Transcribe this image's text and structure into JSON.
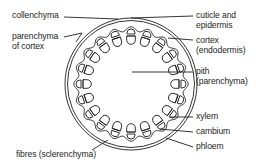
{
  "diagram": {
    "colors": {
      "ink": "#1e1e1e",
      "background": "#ffffff"
    },
    "labels_left": [
      {
        "id": "collenchyma",
        "lines": [
          "collenchyma"
        ]
      },
      {
        "id": "parenchyma-of-cortex",
        "lines": [
          "parenchyma",
          "of cortex"
        ]
      },
      {
        "id": "fibres",
        "lines": [
          "fibres (sclerenchyma)"
        ]
      }
    ],
    "labels_right": [
      {
        "id": "cuticle-and-epidermis",
        "lines": [
          "cuticle and",
          "epidermis"
        ]
      },
      {
        "id": "cortex-endodermis",
        "lines": [
          "cortex",
          "(endodermis)"
        ]
      },
      {
        "id": "pith",
        "lines": [
          "pith",
          "(parenchyma)"
        ]
      },
      {
        "id": "xylem",
        "lines": [
          "xylem"
        ]
      },
      {
        "id": "cambium",
        "lines": [
          "cambium"
        ]
      },
      {
        "id": "phloem",
        "lines": [
          "phloem"
        ]
      }
    ],
    "vascular_bundle_count": 20
  }
}
